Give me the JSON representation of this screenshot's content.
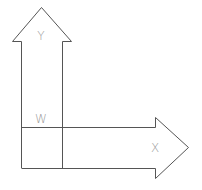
{
  "diagram": {
    "labels": {
      "y_axis": "Y",
      "x_axis": "X",
      "origin": "W"
    },
    "colors": {
      "stroke": "#555555",
      "label": "#9a9a9a",
      "background": "#ffffff"
    }
  }
}
